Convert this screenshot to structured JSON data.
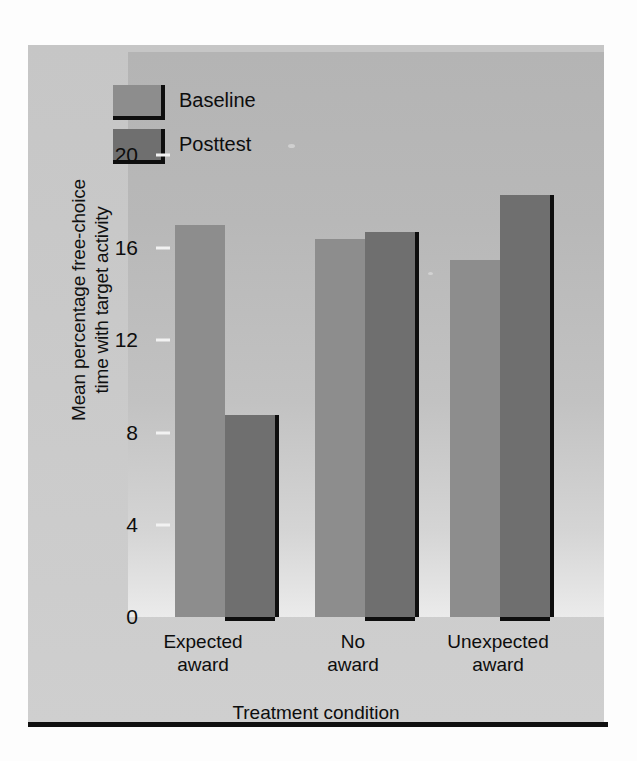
{
  "figure": {
    "background_color": "#c9c9c9",
    "panel_color": "#b8b8b8"
  },
  "legend": {
    "position": "top-left-inside",
    "items": [
      {
        "label": "Baseline",
        "color": "#8d8d8d",
        "swatch_name": "legend-swatch-baseline"
      },
      {
        "label": "Posttest",
        "color": "#6f6f6f",
        "swatch_name": "legend-swatch-posttest"
      }
    ]
  },
  "axes": {
    "y": {
      "title_line1": "Mean percentage free-choice",
      "title_line2": "time with target activity",
      "ticks": [
        "0",
        "4",
        "8",
        "12",
        "16",
        "20"
      ],
      "min": 0,
      "max": 22
    },
    "x": {
      "title": "Treatment condition",
      "groups": [
        {
          "line1": "Expected",
          "line2": "award"
        },
        {
          "line1": "No",
          "line2": "award"
        },
        {
          "line1": "Unexpected",
          "line2": "award"
        }
      ]
    }
  },
  "chart_data": {
    "type": "bar",
    "title": "",
    "xlabel": "Treatment condition",
    "ylabel": "Mean percentage free-choice time with target activity",
    "categories": [
      "Expected award",
      "No award",
      "Unexpected award"
    ],
    "series": [
      {
        "name": "Baseline",
        "color": "#8d8d8d",
        "values": [
          16.9,
          16.3,
          15.4
        ]
      },
      {
        "name": "Posttest",
        "color": "#6f6f6f",
        "values": [
          8.7,
          16.6,
          18.2
        ]
      }
    ],
    "ylim": [
      0,
      22
    ],
    "yticks": [
      0,
      4,
      8,
      12,
      16,
      20
    ],
    "grid": false,
    "legend_position": "upper left (inside plot area)"
  }
}
